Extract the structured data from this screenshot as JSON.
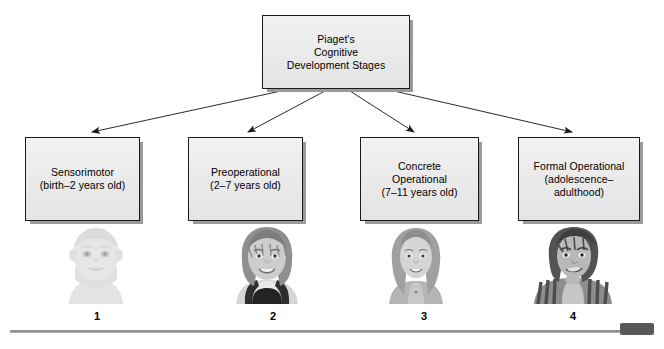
{
  "diagram": {
    "title": "Piaget's Cognitive Development Stages",
    "root": {
      "label": "Piaget's\nCognitive\nDevelopment Stages"
    },
    "stages": [
      {
        "number": "1",
        "name": "Sensorimotor",
        "age_range": "(birth–2 years old)",
        "label": "Sensorimotor\n(birth–2 years old)",
        "portrait_alt": "infant-portrait"
      },
      {
        "number": "2",
        "name": "Preoperational",
        "age_range": "(2–7 years old)",
        "label": "Preoperational\n(2–7 years old)",
        "portrait_alt": "young-child-portrait"
      },
      {
        "number": "3",
        "name": "Concrete Operational",
        "age_range": "(7–11 years old)",
        "label": "Concrete\nOperational\n(7–11 years old)",
        "portrait_alt": "older-child-portrait"
      },
      {
        "number": "4",
        "name": "Formal Operational",
        "age_range": "(adolescence–adulthood)",
        "label": "Formal Operational\n(adolescence–\nadulthood)",
        "portrait_alt": "adolescent-portrait"
      }
    ],
    "colors": {
      "box_fill": "#ebebeb",
      "box_border": "#1a1a1a",
      "box_shadow": "#9a9a9a",
      "connector": "#2a2a2a",
      "text": "#000000",
      "baseline": "#8a8a8a",
      "endcap": "#585858"
    }
  }
}
